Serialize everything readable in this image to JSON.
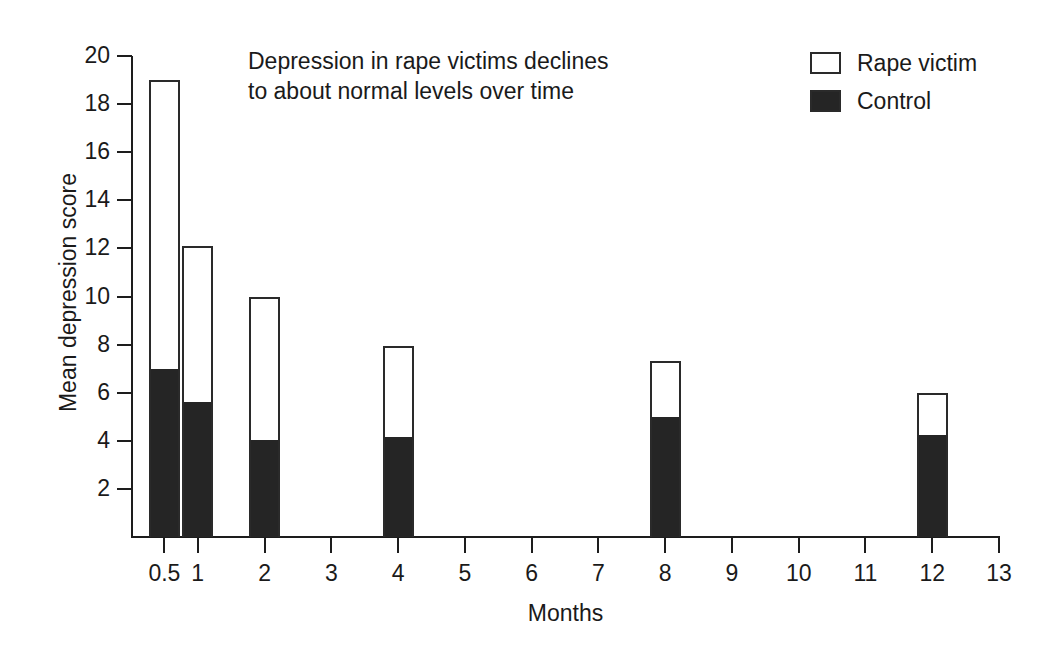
{
  "chart_data": {
    "type": "bar",
    "title": "",
    "annotation": "Depression in rape victims declines to about normal levels over time",
    "annotation_lines": [
      "Depression in rape victims declines",
      "to about normal levels over time"
    ],
    "xlabel": "Months",
    "ylabel": "Mean depression score",
    "xlim": [
      0,
      13
    ],
    "ylim": [
      0,
      20
    ],
    "grid": false,
    "legend_position": "top-right",
    "x_tick_labels": [
      "0.5",
      "1",
      "2",
      "3",
      "4",
      "5",
      "6",
      "7",
      "8",
      "9",
      "10",
      "11",
      "12",
      "13"
    ],
    "x_tick_values": [
      0.5,
      1,
      2,
      3,
      4,
      5,
      6,
      7,
      8,
      9,
      10,
      11,
      12,
      13
    ],
    "y_tick_labels": [
      "2",
      "4",
      "6",
      "8",
      "10",
      "12",
      "14",
      "16",
      "18",
      "20"
    ],
    "y_tick_values": [
      2,
      4,
      6,
      8,
      10,
      12,
      14,
      16,
      18,
      20
    ],
    "categories": [
      "0.5",
      "1",
      "2",
      "4",
      "8",
      "12"
    ],
    "series": [
      {
        "name": "Rape victim",
        "style": "hollow",
        "color": "#ffffff",
        "edge_color": "#2a2a2a",
        "values": [
          19.0,
          12.1,
          10.0,
          7.95,
          7.3,
          6.0
        ]
      },
      {
        "name": "Control",
        "style": "filled",
        "color": "#252525",
        "edge_color": "#252525",
        "values": [
          7.0,
          5.6,
          4.05,
          4.15,
          5.0,
          4.25
        ]
      }
    ],
    "bars": [
      {
        "category": "0.5",
        "x": 0.5,
        "rape_victim": 19.0,
        "control": 7.0
      },
      {
        "category": "1",
        "x": 1,
        "rape_victim": 12.1,
        "control": 5.6
      },
      {
        "category": "2",
        "x": 2,
        "rape_victim": 10.0,
        "control": 4.05
      },
      {
        "category": "4",
        "x": 4,
        "rape_victim": 7.95,
        "control": 4.15
      },
      {
        "category": "8",
        "x": 8,
        "rape_victim": 7.3,
        "control": 5.0
      },
      {
        "category": "12",
        "x": 12,
        "rape_victim": 6.0,
        "control": 4.25
      }
    ],
    "legend": [
      {
        "label": "Rape victim",
        "style": "hollow"
      },
      {
        "label": "Control",
        "style": "filled"
      }
    ],
    "colors": {
      "axis": "#1d1d1d",
      "text": "#1a1a1a",
      "fill_control": "#252525",
      "fill_rape_victim": "#ffffff",
      "background": "#ffffff"
    }
  }
}
